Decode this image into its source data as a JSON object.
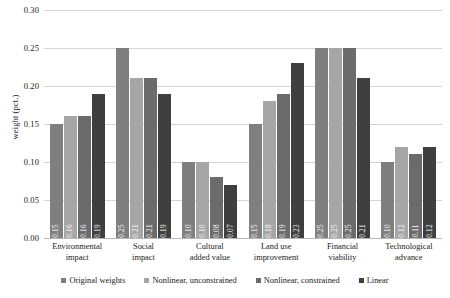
{
  "chart_data": {
    "type": "bar",
    "title": "",
    "xlabel": "",
    "ylabel": "weight (pct.)",
    "ylim": [
      0.0,
      0.3
    ],
    "ytick_labels": [
      "0.30",
      "0.25",
      "0.20",
      "0.15",
      "0.10",
      "0.05",
      "0.00"
    ],
    "ytick_values": [
      0.3,
      0.25,
      0.2,
      0.15,
      0.1,
      0.05,
      0.0
    ],
    "grid": true,
    "legend_position": "bottom",
    "categories": [
      "Environmental impact",
      "Social impact",
      "Cultural added value",
      "Land use improvement",
      "Financial viability",
      "Technological advance"
    ],
    "category_lines": [
      [
        "Environmental",
        "impact"
      ],
      [
        "Social",
        "impact"
      ],
      [
        "Cultural",
        "added value"
      ],
      [
        "Land use",
        "improvement"
      ],
      [
        "Financial",
        "viability"
      ],
      [
        "Technological",
        "advance"
      ]
    ],
    "series": [
      {
        "name": "Original weights",
        "color": "#7f7f7f",
        "values": [
          0.15,
          0.25,
          0.1,
          0.15,
          0.25,
          0.1
        ],
        "labels": [
          "0.15",
          "0.25",
          "0.10",
          "0.15",
          "0.25",
          "0.10"
        ]
      },
      {
        "name": "Nonlinear, unconstrained",
        "color": "#a6a6a6",
        "values": [
          0.16,
          0.21,
          0.1,
          0.18,
          0.25,
          0.12
        ],
        "labels": [
          "0.16",
          "0.21",
          "0.10",
          "0.18",
          "0.25",
          "0.12"
        ]
      },
      {
        "name": "Nonlinear, constrained",
        "color": "#6b6b6b",
        "values": [
          0.16,
          0.21,
          0.08,
          0.19,
          0.25,
          0.11
        ],
        "labels": [
          "0.16",
          "0.21",
          "0.08",
          "0.19",
          "0.25",
          "0.11"
        ]
      },
      {
        "name": "Linear",
        "color": "#3f3f3f",
        "values": [
          0.19,
          0.19,
          0.07,
          0.23,
          0.21,
          0.12
        ],
        "labels": [
          "0.19",
          "0.19",
          "0.07",
          "0.23",
          "0.21",
          "0.12"
        ]
      }
    ]
  }
}
